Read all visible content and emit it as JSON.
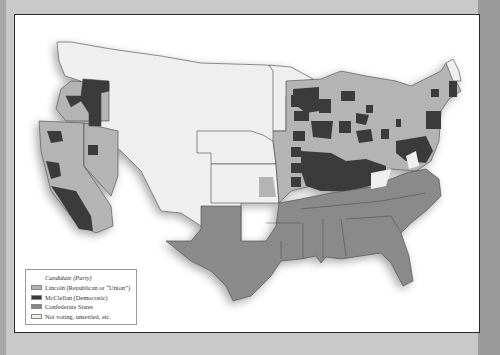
{
  "map": {
    "subject": "1864 United States presidential election results by county",
    "colors": {
      "lincoln": "#b4b4b4",
      "mcclellan": "#3a3a3a",
      "confederate": "#8a8a8a",
      "not_voting": "#efefef",
      "border": "#444444",
      "background": "#ffffff"
    }
  },
  "legend": {
    "title": "Candidate (Party)",
    "items": [
      {
        "label": "Lincoln (Republican or “Union”)",
        "color": "#b4b4b4"
      },
      {
        "label": "McClellan (Democratic)",
        "color": "#3a3a3a"
      },
      {
        "label": "Confederate States",
        "color": "#8a8a8a"
      },
      {
        "label": "Not voting, unsettled, etc.",
        "color": "#efefef"
      }
    ]
  }
}
